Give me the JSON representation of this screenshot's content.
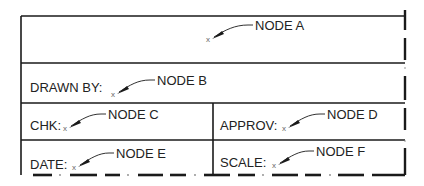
{
  "title_block": {
    "fields": {
      "drawn_by": "DRAWN BY:",
      "chk": "CHK:",
      "approv": "APPROV:",
      "date": "DATE:",
      "scale": "SCALE:"
    },
    "nodes": {
      "a": "NODE A",
      "b": "NODE B",
      "c": "NODE C",
      "d": "NODE D",
      "e": "NODE E",
      "f": "NODE F"
    },
    "marker_glyph": "x",
    "line_color": "#1a1a1a"
  }
}
